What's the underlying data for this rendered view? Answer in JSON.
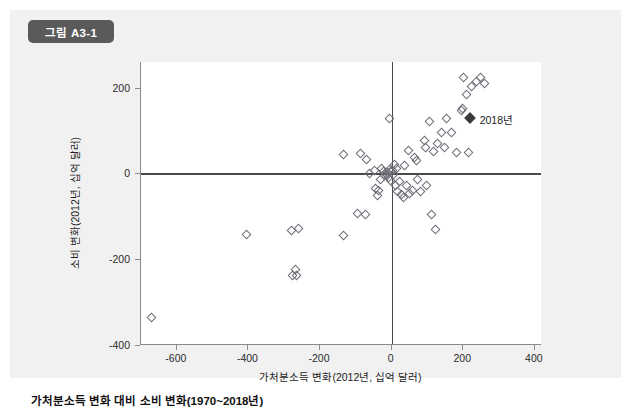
{
  "figure": {
    "badge_label": "그림 A3-1",
    "caption": "가처분소득 변화 대비 소비 변화(1970~2018년)",
    "badge_color": "#5a5a5a",
    "panel_color": "#f1f1f1",
    "marker_color": "#6d6d77",
    "highlight_color": "#3b3b3b"
  },
  "chart_data": {
    "type": "scatter",
    "title": "가처분소득 변화 대비 소비 변화(1970~2018년)",
    "xlabel": "가처분소득 변화(2012년, 십억 달러)",
    "ylabel": "소비 변화(2012년, 십억 달러)",
    "xlim": [
      -700,
      420
    ],
    "ylim": [
      -400,
      260
    ],
    "xticks": [
      -600,
      -400,
      -200,
      0,
      200,
      400
    ],
    "yticks": [
      -400,
      -200,
      0,
      200
    ],
    "xticklabels": [
      "-600",
      "-400",
      "-200",
      "0",
      "200",
      "400"
    ],
    "yticklabels": [
      "-400",
      "-200",
      "0",
      "200"
    ],
    "grid": false,
    "legend": false,
    "reference_lines": {
      "x": 0,
      "y": 0
    },
    "annotations": [
      {
        "label": "2018년",
        "x": 218,
        "y": 130,
        "marker": "filled-diamond"
      }
    ],
    "series": [
      {
        "name": "연도별 관측치",
        "marker": "open-diamond",
        "points": [
          [
            -672,
            -336
          ],
          [
            -404,
            -142
          ],
          [
            -279,
            -133
          ],
          [
            -259,
            -129
          ],
          [
            -269,
            -224
          ],
          [
            -266,
            -239
          ],
          [
            -276,
            -237
          ],
          [
            -135,
            -145
          ],
          [
            -135,
            45
          ],
          [
            -94,
            -93
          ],
          [
            -72,
            -96
          ],
          [
            -88,
            47
          ],
          [
            -69,
            33
          ],
          [
            -61,
            1
          ],
          [
            -47,
            7
          ],
          [
            -44,
            -36
          ],
          [
            -39,
            -51
          ],
          [
            -36,
            -40
          ],
          [
            -30,
            -13
          ],
          [
            -27,
            11
          ],
          [
            -24,
            5
          ],
          [
            -19,
            -4
          ],
          [
            -14,
            -2
          ],
          [
            -11,
            3
          ],
          [
            -8,
            -9
          ],
          [
            -6,
            9
          ],
          [
            -4,
            -17
          ],
          [
            -2,
            4
          ],
          [
            2,
            6
          ],
          [
            5,
            -2
          ],
          [
            8,
            22
          ],
          [
            11,
            -29
          ],
          [
            14,
            12
          ],
          [
            17,
            -43
          ],
          [
            21,
            -18
          ],
          [
            28,
            -49
          ],
          [
            33,
            -56
          ],
          [
            36,
            19
          ],
          [
            42,
            -29
          ],
          [
            47,
            54
          ],
          [
            50,
            -47
          ],
          [
            58,
            -40
          ],
          [
            64,
            38
          ],
          [
            69,
            30
          ],
          [
            72,
            -13
          ],
          [
            80,
            -42
          ],
          [
            91,
            78
          ],
          [
            94,
            60
          ],
          [
            97,
            -29
          ],
          [
            105,
            122
          ],
          [
            110,
            -96
          ],
          [
            116,
            52
          ],
          [
            122,
            -131
          ],
          [
            127,
            70
          ],
          [
            138,
            96
          ],
          [
            147,
            60
          ],
          [
            152,
            128
          ],
          [
            166,
            96
          ],
          [
            180,
            49
          ],
          [
            194,
            148
          ],
          [
            199,
            152
          ],
          [
            202,
            225
          ],
          [
            210,
            185
          ],
          [
            215,
            48
          ],
          [
            224,
            202
          ],
          [
            238,
            214
          ],
          [
            247,
            225
          ],
          [
            260,
            209
          ],
          [
            -5,
            128
          ]
        ]
      }
    ]
  }
}
